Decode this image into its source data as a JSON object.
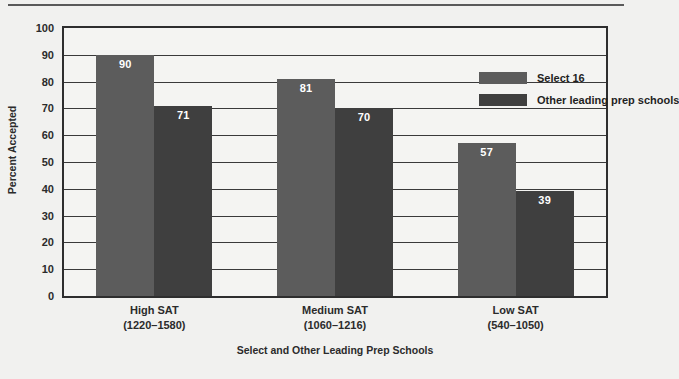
{
  "chart_data": {
    "type": "bar",
    "title": "",
    "xlabel": "Select and Other Leading Prep Schools",
    "ylabel": "Percent Accepted",
    "ylim": [
      0,
      100
    ],
    "ytick_step": 10,
    "yticks": [
      "100",
      "90",
      "80",
      "70",
      "60",
      "50",
      "40",
      "30",
      "20",
      "10",
      "0"
    ],
    "grid": true,
    "legend_position": "top-right",
    "categories": [
      "High SAT",
      "Medium SAT",
      "Low SAT"
    ],
    "category_sublabels": [
      "(1220–1580)",
      "(1060–1216)",
      "(540–1050)"
    ],
    "series": [
      {
        "name": "Select 16",
        "color": "#5c5c5c",
        "values": [
          90,
          81,
          57
        ]
      },
      {
        "name": "Other leading prep schools",
        "color": "#3f3f3f",
        "values": [
          71,
          70,
          39
        ]
      }
    ]
  },
  "legend": {
    "items": [
      {
        "label": "Select 16",
        "color": "#5c5c5c"
      },
      {
        "label": "Other leading prep schools",
        "color": "#3f3f3f"
      }
    ]
  },
  "axes": {
    "y_title": "Percent Accepted",
    "x_title": "Select and Other Leading Prep Schools"
  },
  "colors": {
    "background": "#f1f1ef",
    "plot_background": "#f4f4f2",
    "frame": "#2e2e2e",
    "gridline": "#3a3a3a",
    "series_a": "#5c5c5c",
    "series_b": "#3f3f3f",
    "value_label": "#ffffff",
    "text": "#2b2b2b",
    "rule": "#5a5a5a"
  }
}
